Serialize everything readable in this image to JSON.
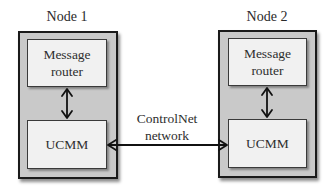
{
  "diagram": {
    "type": "block-diagram",
    "nodes": [
      {
        "title": "Node 1",
        "components": {
          "top": {
            "line1": "Message",
            "line2": "router"
          },
          "bottom": {
            "label": "UCMM"
          }
        }
      },
      {
        "title": "Node 2",
        "components": {
          "top": {
            "line1": "Message",
            "line2": "router"
          },
          "bottom": {
            "label": "UCMM"
          }
        }
      }
    ],
    "network": {
      "line1": "ControlNet",
      "line2": "network"
    },
    "connections": [
      {
        "from": "Node 1 Message router",
        "to": "Node 1 UCMM",
        "direction": "bidirectional"
      },
      {
        "from": "Node 2 Message router",
        "to": "Node 2 UCMM",
        "direction": "bidirectional"
      },
      {
        "from": "Node 1 UCMM",
        "to": "Node 2 UCMM",
        "via": "ControlNet network",
        "direction": "bidirectional"
      }
    ],
    "colors": {
      "node_fill": "#c9c9c9",
      "component_fill": "#f1f1f1",
      "border": "#1a1a1a",
      "text": "#2e2e2e"
    }
  }
}
